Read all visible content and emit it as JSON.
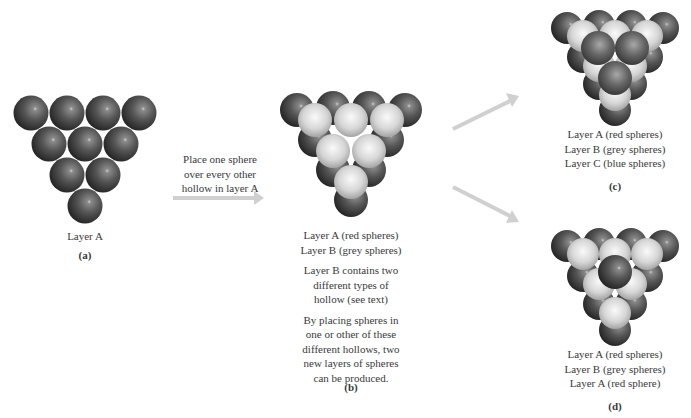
{
  "panels": {
    "a": {
      "caption_lines": [
        "Layer A"
      ],
      "label": "(a)"
    },
    "arrow_ab": {
      "text_lines": [
        "Place one sphere",
        "over every other",
        "hollow in layer A"
      ]
    },
    "b": {
      "caption_lines": [
        "Layer A (red spheres)",
        "Layer B (grey spheres)"
      ],
      "para1_lines": [
        "Layer B contains two",
        "different types of",
        "hollow (see text)"
      ],
      "para2_lines": [
        "By placing spheres in",
        "one or other of these",
        "different hollows, two",
        "new layers of spheres",
        "can be produced."
      ],
      "label": "(b)"
    },
    "c": {
      "caption_lines": [
        "Layer A (red spheres)",
        "Layer B (grey spheres)",
        "Layer C (blue spheres)"
      ],
      "label": "(c)"
    },
    "d": {
      "caption_lines": [
        "Layer A (red spheres)",
        "Layer B (grey spheres)",
        "Layer A (red sphere)"
      ],
      "label": "(d)"
    }
  },
  "colors": {
    "dark_sphere": "#4a4a4a",
    "light_sphere": "#d8d8d8",
    "mid_sphere": "#5e5e5e",
    "arrow": "#d0d0d0",
    "text": "#3a3a3a"
  }
}
